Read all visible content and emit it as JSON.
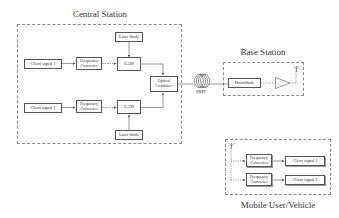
{
  "central_station": {
    "title": "Central Station",
    "top_chain": {
      "client_signal": "Client signal 1",
      "frequency_converter": "Frequency\nConverter",
      "eam": "EAM",
      "laser_diode": "Laser diode"
    },
    "bottom_chain": {
      "client_signal": "Client signal 1",
      "frequency_converter": "Frequency\nConverter",
      "eam": "EAM",
      "laser_diode": "Laser diode"
    },
    "optical_combiner": "Optical\nCombiner"
  },
  "fiber": {
    "label": "SMF",
    "icon": "fiber-coil-icon"
  },
  "base_station": {
    "title": "Base Station",
    "photodiode": "Photodiode",
    "amplifier_icon": "amplifier-triangle-icon",
    "antenna_icon": "antenna-icon"
  },
  "mobile_user": {
    "title": "Mobile User/Vehicle",
    "antenna_icon": "antenna-icon",
    "rows": [
      {
        "frequency_converter": "Frequency\nConverter",
        "client_signal": "Client signal 1"
      },
      {
        "frequency_converter": "Frequency\nConverter",
        "client_signal": "Client signal 2"
      }
    ]
  },
  "colors": {
    "line": "#555555",
    "dashed_border": "#8a8a8a",
    "text": "#333333"
  }
}
